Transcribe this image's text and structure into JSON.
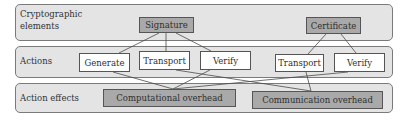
{
  "layers": [
    {
      "id": "cryptographic-elements",
      "label_line1": "Cryptographic",
      "label_line2": "elements"
    },
    {
      "id": "actions",
      "label": "Actions"
    },
    {
      "id": "action-effects",
      "label": "Action effects"
    }
  ],
  "elements": {
    "signature": "Signature",
    "certificate": "Certificate"
  },
  "actions": {
    "signature_generate": "Generate",
    "signature_transport": "Transport",
    "signature_verify": "Verify",
    "certificate_transport": "Transport",
    "certificate_verify": "Verify"
  },
  "effects": {
    "computational": "Computational overhead",
    "communication": "Communication overhead"
  },
  "edges": [
    [
      "Signature",
      "Generate"
    ],
    [
      "Signature",
      "Transport"
    ],
    [
      "Signature",
      "Verify"
    ],
    [
      "Certificate",
      "Transport"
    ],
    [
      "Certificate",
      "Verify"
    ],
    [
      "Generate",
      "Computational overhead"
    ],
    [
      "Verify (Signature)",
      "Computational overhead"
    ],
    [
      "Verify (Certificate)",
      "Computational overhead"
    ],
    [
      "Transport (Signature)",
      "Communication overhead"
    ],
    [
      "Transport (Certificate)",
      "Communication overhead"
    ]
  ],
  "colors": {
    "band_fill": "#e4e4e4",
    "element_fill": "#a9a9a9",
    "action_fill": "#ffffff",
    "line": "#4a4a4a"
  }
}
